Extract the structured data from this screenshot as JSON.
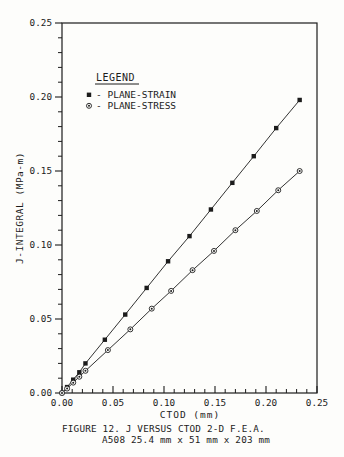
{
  "figure": {
    "caption_line1": "FIGURE 12. J VERSUS CTOD 2-D F.E.A.",
    "caption_line2": "A508  25.4 mm x 51 mm x 203 mm"
  },
  "chart_data": {
    "type": "line",
    "title": "",
    "xlabel": "CTOD (mm)",
    "ylabel": "J-INTEGRAL (MPa-m)",
    "xlim": [
      0,
      0.25
    ],
    "ylim": [
      0,
      0.25
    ],
    "x_tick_values": [
      0,
      0.05,
      0.1,
      0.15,
      0.2,
      0.25
    ],
    "x_tick_labels": [
      "0.00",
      "0.05",
      "0.10",
      "0.15",
      "0.20",
      "0.25"
    ],
    "y_tick_values": [
      0,
      0.05,
      0.1,
      0.15,
      0.2,
      0.25
    ],
    "y_tick_labels": [
      "0.00",
      "0.05",
      "0.10",
      "0.15",
      "0.20",
      "0.25"
    ],
    "minor_tick_step": 0.01,
    "grid": false,
    "line_color": "#1c1c1c",
    "legend": {
      "title": "LEGEND",
      "separator": "-",
      "position": "upper-left"
    },
    "series": [
      {
        "name": "PLANE-STRAIN",
        "marker": "filled-square",
        "points": [
          [
            0,
            0
          ],
          [
            0.005,
            0.004
          ],
          [
            0.011,
            0.009
          ],
          [
            0.017,
            0.014
          ],
          [
            0.023,
            0.02
          ],
          [
            0.042,
            0.036
          ],
          [
            0.062,
            0.053
          ],
          [
            0.083,
            0.071
          ],
          [
            0.104,
            0.089
          ],
          [
            0.125,
            0.106
          ],
          [
            0.146,
            0.124
          ],
          [
            0.167,
            0.142
          ],
          [
            0.188,
            0.16
          ],
          [
            0.21,
            0.179
          ],
          [
            0.233,
            0.198
          ]
        ]
      },
      {
        "name": "PLANE-STRESS",
        "marker": "circle-dot",
        "points": [
          [
            0,
            0
          ],
          [
            0.005,
            0.003
          ],
          [
            0.011,
            0.007
          ],
          [
            0.017,
            0.011
          ],
          [
            0.023,
            0.015
          ],
          [
            0.045,
            0.029
          ],
          [
            0.067,
            0.043
          ],
          [
            0.088,
            0.057
          ],
          [
            0.107,
            0.069
          ],
          [
            0.128,
            0.083
          ],
          [
            0.149,
            0.096
          ],
          [
            0.17,
            0.11
          ],
          [
            0.191,
            0.123
          ],
          [
            0.212,
            0.137
          ],
          [
            0.233,
            0.15
          ]
        ]
      }
    ]
  }
}
